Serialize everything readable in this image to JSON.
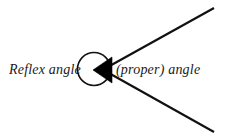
{
  "figure": {
    "background_color": "#ffffff",
    "stroke_color": "#111111",
    "fill_color": "#000000",
    "labels": {
      "reflex": "Reflex angle",
      "proper": "(proper) angle"
    },
    "geometry": {
      "vertex": {
        "x": 108,
        "y": 70
      },
      "circle": {
        "cx": 94,
        "cy": 69,
        "r": 16.5,
        "stroke_width": 1.6
      },
      "wedge": {
        "apex": {
          "x": 93,
          "y": 70
        },
        "upper": {
          "x": 112,
          "y": 57
        },
        "lower": {
          "x": 112,
          "y": 83
        }
      },
      "ray_upper": {
        "x1": 106,
        "y1": 68,
        "x2": 214,
        "y2": 8,
        "stroke_width": 2.2
      },
      "ray_lower": {
        "x1": 107,
        "y1": 72,
        "x2": 214,
        "y2": 132,
        "stroke_width": 2.2
      }
    }
  }
}
